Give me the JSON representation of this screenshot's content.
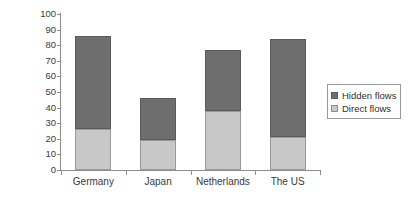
{
  "chart_data": {
    "type": "bar",
    "subtype": "stacked-bar",
    "title": "",
    "xlabel": "",
    "ylabel": "Metric tonnes per capita",
    "ylim": [
      0,
      100
    ],
    "yticks": [
      0,
      10,
      20,
      30,
      40,
      50,
      60,
      70,
      80,
      90,
      100
    ],
    "grid": false,
    "legend_position": "right",
    "categories": [
      "Germany",
      "Japan",
      "Netherlands",
      "The US"
    ],
    "series": [
      {
        "name": "Direct flows",
        "color": "#c8c8c8",
        "values": [
          26,
          19,
          38,
          21
        ]
      },
      {
        "name": "Hidden flows",
        "color": "#6e6e6e",
        "values": [
          60,
          27,
          39,
          63
        ]
      }
    ],
    "totals": [
      86,
      46,
      77,
      84
    ],
    "stack_order": [
      "Direct flows",
      "Hidden flows"
    ]
  },
  "axis": {
    "y_title": "Metric tonnes per capita"
  },
  "legend": {
    "items": [
      {
        "label": "Hidden flows",
        "color": "#6e6e6e"
      },
      {
        "label": "Direct flows",
        "color": "#c8c8c8"
      }
    ]
  }
}
